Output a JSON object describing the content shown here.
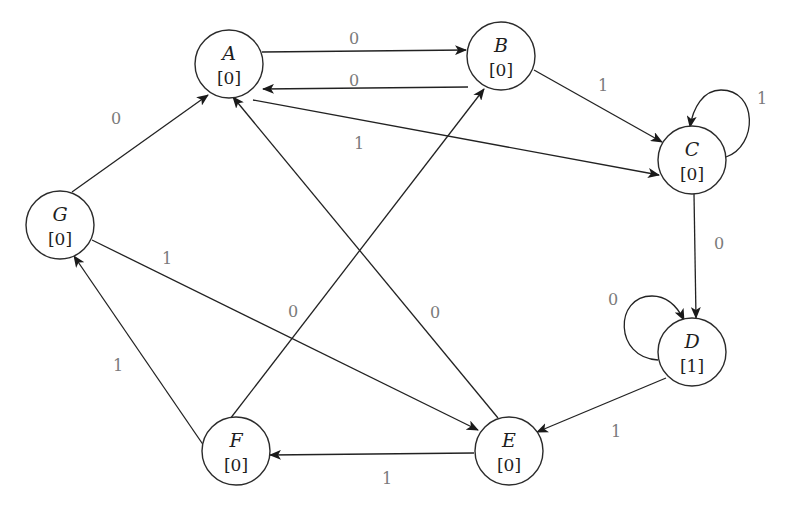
{
  "diagram": {
    "type": "moore-machine-state-diagram",
    "colors": {
      "stroke": "#222222",
      "label": "#7a7a7a",
      "text": "#1e1e1e",
      "background": "#ffffff"
    },
    "nodes": [
      {
        "id": "A",
        "name": "A",
        "output": "[0]",
        "x": 229,
        "y": 64
      },
      {
        "id": "B",
        "name": "B",
        "output": "[0]",
        "x": 501,
        "y": 56
      },
      {
        "id": "C",
        "name": "C",
        "output": "[0]",
        "x": 692,
        "y": 160
      },
      {
        "id": "D",
        "name": "D",
        "output": "[1]",
        "x": 692,
        "y": 352
      },
      {
        "id": "E",
        "name": "E",
        "output": "[0]",
        "x": 509,
        "y": 451
      },
      {
        "id": "F",
        "name": "F",
        "output": "[0]",
        "x": 236,
        "y": 451
      },
      {
        "id": "G",
        "name": "G",
        "output": "[0]",
        "x": 60,
        "y": 225
      }
    ],
    "edges": [
      {
        "from": "A",
        "to": "B",
        "label": "0",
        "lx": 354,
        "ly": 44
      },
      {
        "from": "B",
        "to": "A",
        "label": "0",
        "lx": 354,
        "ly": 86
      },
      {
        "from": "B",
        "to": "C",
        "label": "1",
        "lx": 603,
        "ly": 91
      },
      {
        "from": "A",
        "to": "C",
        "label": "1",
        "lx": 359,
        "ly": 149
      },
      {
        "from": "C",
        "to": "C",
        "label": "1",
        "lx": 762,
        "ly": 104
      },
      {
        "from": "C",
        "to": "D",
        "label": "0",
        "lx": 719,
        "ly": 249
      },
      {
        "from": "D",
        "to": "D",
        "label": "0",
        "lx": 613,
        "ly": 305
      },
      {
        "from": "D",
        "to": "E",
        "label": "1",
        "lx": 616,
        "ly": 437
      },
      {
        "from": "E",
        "to": "F",
        "label": "1",
        "lx": 387,
        "ly": 484
      },
      {
        "from": "F",
        "to": "G",
        "label": "1",
        "lx": 118,
        "ly": 371
      },
      {
        "from": "G",
        "to": "A",
        "label": "0",
        "lx": 116,
        "ly": 124
      },
      {
        "from": "G",
        "to": "E",
        "label": "1",
        "lx": 167,
        "ly": 264
      },
      {
        "from": "F",
        "to": "B",
        "label": "0",
        "lx": 293,
        "ly": 317
      },
      {
        "from": "E",
        "to": "A",
        "label": "0",
        "lx": 435,
        "ly": 318
      }
    ]
  }
}
